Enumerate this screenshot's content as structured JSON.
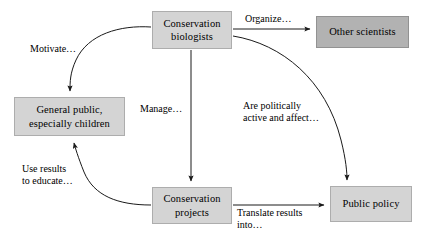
{
  "diagram": {
    "background_color": "#ffffff",
    "line_color": "#1a1a1a",
    "nodes": [
      {
        "id": "conservation-biologists",
        "label": "Conservation\nbiologists",
        "fill": "#d4d4d4",
        "x": 152,
        "y": 11,
        "w": 80,
        "h": 38
      },
      {
        "id": "other-scientists",
        "label": "Other scientists",
        "fill": "#b2b2b2",
        "x": 316,
        "y": 16,
        "w": 93,
        "h": 32
      },
      {
        "id": "general-public",
        "label": "General public,\nespecially children",
        "fill": "#d4d4d4",
        "x": 14,
        "y": 97,
        "w": 111,
        "h": 39
      },
      {
        "id": "conservation-projects",
        "label": "Conservation\nprojects",
        "fill": "#d4d4d4",
        "x": 152,
        "y": 187,
        "w": 80,
        "h": 37
      },
      {
        "id": "public-policy",
        "label": "Public policy",
        "fill": "#d4d4d4",
        "x": 330,
        "y": 186,
        "w": 82,
        "h": 36
      }
    ],
    "edges": [
      {
        "id": "motivate",
        "from": "conservation-biologists",
        "to": "general-public",
        "label": "Motivate…",
        "label_x": 30,
        "label_y": 43
      },
      {
        "id": "organize",
        "from": "conservation-biologists",
        "to": "other-scientists",
        "label": "Organize…",
        "label_x": 245,
        "label_y": 13
      },
      {
        "id": "manage",
        "from": "conservation-biologists",
        "to": "conservation-projects",
        "label": "Manage…",
        "label_x": 140,
        "label_y": 103
      },
      {
        "id": "are-politically-active",
        "from": "conservation-biologists",
        "to": "public-policy",
        "label": "Are politically\nactive and affect…",
        "label_x": 243,
        "label_y": 100
      },
      {
        "id": "use-results-to-educate",
        "from": "conservation-projects",
        "to": "general-public",
        "label": "Use results\nto educate…",
        "label_x": 22,
        "label_y": 163
      },
      {
        "id": "translate-results",
        "from": "conservation-projects",
        "to": "public-policy",
        "label": "Translate results\ninto…",
        "label_x": 237,
        "label_y": 207
      }
    ]
  }
}
